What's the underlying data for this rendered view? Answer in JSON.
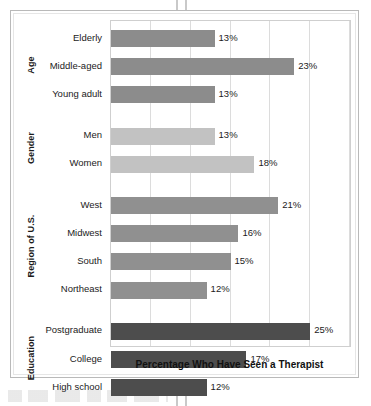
{
  "figure": {
    "axis_title": "Percentage Who Have Seen a Therapist"
  },
  "chart_data": {
    "type": "bar",
    "orientation": "horizontal",
    "title": "",
    "xlabel": "Percentage Who Have Seen a Therapist",
    "ylabel": "",
    "xlim": [
      0,
      30
    ],
    "xticks": [
      0,
      5,
      10,
      15,
      20,
      25,
      30
    ],
    "xtick_labels": [
      "",
      "",
      "",
      "",
      "",
      "",
      ""
    ],
    "grid": "vertical",
    "legend": "none",
    "value_label_suffix": "%",
    "groups": [
      {
        "name": "Age",
        "color": "#8c8c8c",
        "categories": [
          "Elderly",
          "Middle-aged",
          "Young adult"
        ],
        "values": [
          13,
          23,
          13
        ],
        "value_labels": [
          "13%",
          "23%",
          "13%"
        ]
      },
      {
        "name": "Gender",
        "color": "#c2c2c2",
        "categories": [
          "Men",
          "Women"
        ],
        "values": [
          13,
          18
        ],
        "value_labels": [
          "13%",
          "18%"
        ]
      },
      {
        "name": "Region of U.S.",
        "color": "#909090",
        "categories": [
          "West",
          "Midwest",
          "South",
          "Northeast"
        ],
        "values": [
          21,
          16,
          15,
          12
        ],
        "value_labels": [
          "21%",
          "16%",
          "15%",
          "12%"
        ]
      },
      {
        "name": "Education",
        "color": "#4d4d4d",
        "categories": [
          "Postgraduate",
          "College",
          "High school"
        ],
        "values": [
          25,
          17,
          12
        ],
        "value_labels": [
          "25%",
          "17%",
          "12%"
        ]
      }
    ]
  }
}
